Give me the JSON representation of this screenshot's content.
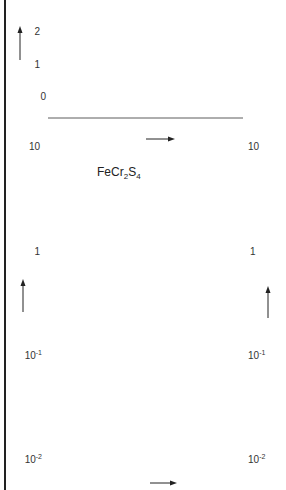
{
  "chart_data": [
    {
      "id": "b",
      "type": "line",
      "panel_label": "b",
      "xlabel": "B",
      "x_unit_primary": "G",
      "x_ticks_primary": [
        "0",
        "2",
        "4",
        "6",
        "8",
        "10",
        "12"
      ],
      "x_unit_secondary": "Vs m⁻²",
      "x_ticks_secondary": [
        "0",
        "0,2",
        "0,4",
        "0,6",
        "0,8",
        "1,2"
      ],
      "ylabel": "U_H",
      "y_unit": "V",
      "y_ticks": [
        "0",
        "1",
        "2"
      ],
      "xlim": [
        0,
        12
      ],
      "ylim": [
        0,
        2.5
      ],
      "grid": true,
      "series": [
        {
          "name": "steep line",
          "style": "solid",
          "x": [
            0,
            2.6
          ],
          "y": [
            0,
            2.5
          ]
        },
        {
          "name": "shallow line",
          "style": "solid",
          "x": [
            0,
            12
          ],
          "y": [
            1.5,
            2.15
          ]
        },
        {
          "name": "data points",
          "style": "markers",
          "x": [
            0.6,
            0.9,
            1.1,
            1.3,
            1.5,
            1.6,
            1.95,
            2.2,
            2.8,
            4.5,
            6.2,
            7.9,
            8.6,
            9.6,
            10.8
          ],
          "y": [
            0.5,
            0.75,
            1.0,
            1.25,
            1.4,
            1.55,
            1.5,
            1.65,
            1.68,
            1.78,
            1.88,
            1.95,
            2.0,
            2.05,
            2.1
          ]
        }
      ]
    },
    {
      "id": "a",
      "type": "line",
      "panel_label": "a",
      "title": "FeCr₂S₄",
      "xlabel": "T",
      "x_unit": "K",
      "x_ticks": [
        "75",
        "100",
        "125",
        "150",
        "175",
        "200",
        "225",
        "250"
      ],
      "xlim": [
        75,
        250
      ],
      "ylabel_left": "σ",
      "y_unit_left": "(Ωcm)⁻¹",
      "ylabel_right": "μ_p",
      "y_unit_right": "cm²(Vs)⁻¹",
      "y_scale": "log",
      "ylim": [
        0.01,
        10
      ],
      "y_ticks_left": [
        "10",
        "1",
        "10⁻¹",
        "10⁻²"
      ],
      "y_ticks_right": [
        "10",
        "1",
        "10⁻¹",
        "10⁻²"
      ],
      "grid": true,
      "series": [
        {
          "name": "σ",
          "style": "solid with circles",
          "x": [
            78,
            85,
            90,
            95,
            100,
            105,
            110,
            115,
            120,
            125,
            130,
            135,
            140,
            145,
            150,
            153,
            157,
            160,
            165,
            170,
            175,
            180,
            185,
            190,
            193,
            196,
            200,
            205,
            210,
            215,
            220,
            225,
            230,
            235,
            240,
            245,
            250
          ],
          "y": [
            0.068,
            0.082,
            0.095,
            0.11,
            0.125,
            0.145,
            0.165,
            0.19,
            0.21,
            0.235,
            0.255,
            0.275,
            0.29,
            0.305,
            0.315,
            0.318,
            0.31,
            0.3,
            0.28,
            0.255,
            0.235,
            0.215,
            0.2,
            0.19,
            0.185,
            0.19,
            0.2,
            0.215,
            0.24,
            0.265,
            0.29,
            0.32,
            0.35,
            0.38,
            0.42,
            0.46,
            0.5
          ]
        },
        {
          "name": "μ_p",
          "style": "dashed",
          "x": [
            75,
            100,
            125,
            140,
            150,
            160,
            170,
            180,
            188,
            195,
            200,
            210,
            220,
            230,
            240,
            250
          ],
          "y": [
            10,
            4.0,
            1.5,
            0.75,
            0.45,
            0.25,
            0.12,
            0.05,
            0.025,
            0.012,
            0.016,
            0.021,
            0.025,
            0.028,
            0.03,
            0.032
          ]
        }
      ]
    }
  ],
  "labels": {
    "top_panel": "b",
    "bottom_panel": "a",
    "compound": "FeCr₂S₄",
    "uh": "U",
    "uh_sub": "H",
    "b_axis": "B",
    "t_axis": "T",
    "sigma": "σ",
    "mu": "μ",
    "mu_sub": "p",
    "v_unit": "V",
    "g_unit": "G",
    "vsm": "Vs m",
    "vsm_exp": "-2",
    "k_unit": "K",
    "left_unit": "(Ωcm)",
    "left_unit_exp": "-1",
    "right_unit": "cm²(Vs)",
    "right_unit_exp": "-1"
  }
}
